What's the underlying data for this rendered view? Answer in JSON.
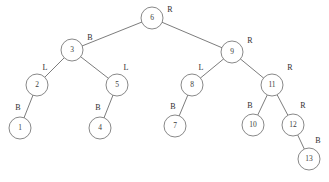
{
  "figure": {
    "background_color": "#ffffff",
    "stroke_color": "#5a5a5a",
    "node_fill_color": "#ffffff",
    "text_color": "#3c3c3c",
    "width": 329,
    "height": 182
  },
  "chart_data": {
    "type": "diagram",
    "diagram_kind": "binary-tree",
    "title": "",
    "node_radius": 11,
    "label_legend": {
      "R": "R",
      "B": "B",
      "L": "L"
    },
    "nodes": [
      {
        "id": "n6",
        "value": "6",
        "label": "R",
        "x": 152,
        "y": 18,
        "label_x": 170,
        "label_y": 10,
        "parent": null,
        "side": null
      },
      {
        "id": "n3",
        "value": "3",
        "label": "B",
        "x": 72,
        "y": 50,
        "label_x": 90,
        "label_y": 38,
        "parent": "n6",
        "side": "left"
      },
      {
        "id": "n9",
        "value": "9",
        "label": "R",
        "x": 232,
        "y": 52,
        "label_x": 250,
        "label_y": 41,
        "parent": "n6",
        "side": "right"
      },
      {
        "id": "n2",
        "value": "2",
        "label": "L",
        "x": 37,
        "y": 85,
        "label_x": 45,
        "label_y": 68,
        "parent": "n3",
        "side": "left"
      },
      {
        "id": "n5",
        "value": "5",
        "label": "L",
        "x": 117,
        "y": 85,
        "label_x": 126,
        "label_y": 68,
        "parent": "n3",
        "side": "right"
      },
      {
        "id": "n8",
        "value": "8",
        "label": "L",
        "x": 192,
        "y": 85,
        "label_x": 201,
        "label_y": 68,
        "parent": "n9",
        "side": "left"
      },
      {
        "id": "n11",
        "value": "11",
        "label": "R",
        "x": 272,
        "y": 85,
        "label_x": 290,
        "label_y": 68,
        "parent": "n9",
        "side": "right"
      },
      {
        "id": "n1",
        "value": "1",
        "label": "B",
        "x": 20,
        "y": 128,
        "label_x": 18,
        "label_y": 108,
        "parent": "n2",
        "side": "left"
      },
      {
        "id": "n4",
        "value": "4",
        "label": "B",
        "x": 100,
        "y": 128,
        "label_x": 98,
        "label_y": 108,
        "parent": "n5",
        "side": "left"
      },
      {
        "id": "n7",
        "value": "7",
        "label": "B",
        "x": 175,
        "y": 126,
        "label_x": 173,
        "label_y": 107,
        "parent": "n8",
        "side": "left"
      },
      {
        "id": "n10",
        "value": "10",
        "label": "B",
        "x": 253,
        "y": 125,
        "label_x": 250,
        "label_y": 106,
        "parent": "n11",
        "side": "left"
      },
      {
        "id": "n12",
        "value": "12",
        "label": "R",
        "x": 293,
        "y": 125,
        "label_x": 303,
        "label_y": 106,
        "parent": "n11",
        "side": "right"
      },
      {
        "id": "n13",
        "value": "13",
        "label": "B",
        "x": 309,
        "y": 159,
        "label_x": 318,
        "label_y": 141,
        "parent": "n12",
        "side": "right"
      }
    ],
    "edges": [
      {
        "from": "n6",
        "to": "n3"
      },
      {
        "from": "n6",
        "to": "n9"
      },
      {
        "from": "n3",
        "to": "n2"
      },
      {
        "from": "n3",
        "to": "n5"
      },
      {
        "from": "n9",
        "to": "n8"
      },
      {
        "from": "n9",
        "to": "n11"
      },
      {
        "from": "n2",
        "to": "n1"
      },
      {
        "from": "n5",
        "to": "n4"
      },
      {
        "from": "n8",
        "to": "n7"
      },
      {
        "from": "n11",
        "to": "n10"
      },
      {
        "from": "n11",
        "to": "n12"
      },
      {
        "from": "n12",
        "to": "n13"
      }
    ]
  }
}
